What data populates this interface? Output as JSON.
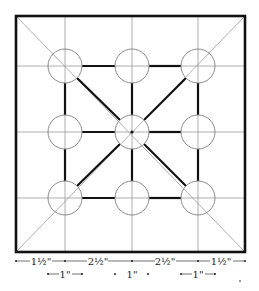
{
  "diagram": {
    "colors": {
      "border": "#111111",
      "thick_line": "#111111",
      "thin_line": "#9a9a9a",
      "circle": "#8a8a8a",
      "text": "#222222",
      "background": "#ffffff"
    },
    "outer_square": {
      "x1": 16,
      "y1": 16,
      "x2": 245,
      "y2": 252
    },
    "grid_x": [
      65,
      132,
      198
    ],
    "grid_y": [
      66,
      132,
      198
    ],
    "circle_radius": 17,
    "dimensions_row1": [
      {
        "label": "1½\"",
        "from": 16,
        "to": 65
      },
      {
        "label": "2½\"",
        "from": 65,
        "to": 132
      },
      {
        "label": "2½\"",
        "from": 132,
        "to": 198
      },
      {
        "label": "1½\"",
        "from": 198,
        "to": 245
      }
    ],
    "dimensions_row2": [
      {
        "label": "1\"",
        "from": 48,
        "to": 82
      },
      {
        "label": "1\"",
        "from": 115,
        "to": 148
      },
      {
        "label": "1\"",
        "from": 181,
        "to": 215
      }
    ]
  },
  "labels": {
    "dim1_a": "1½\"",
    "dim1_b": "2½\"",
    "dim1_c": "2½\"",
    "dim1_d": "1½\"",
    "dim2_a": "1\"",
    "dim2_b": "1\"",
    "dim2_c": "1\""
  }
}
